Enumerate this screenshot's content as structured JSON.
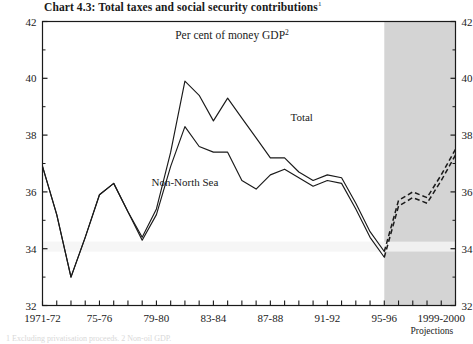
{
  "chart_data": {
    "type": "line",
    "title": "Chart 4.3: Total taxes and social security contributions",
    "title_superscript": "1",
    "subtitle": "Per cent of money GDP",
    "subtitle_superscript": "2",
    "xlabel": "",
    "ylabel": "",
    "ylim": [
      32,
      42
    ],
    "y_ticks": [
      32,
      34,
      36,
      38,
      40,
      42
    ],
    "y_minor_ticks": [
      33,
      35,
      37,
      39,
      41
    ],
    "grid": false,
    "legend_position": "inline-annotations",
    "x_tick_labels": [
      "1971-72",
      "75-76",
      "79-80",
      "83-84",
      "87-88",
      "91-92",
      "95-96",
      "1999-2000"
    ],
    "x_tick_label_indices": [
      0,
      4,
      8,
      12,
      16,
      20,
      24,
      28
    ],
    "x_categories": [
      "1971-72",
      "1972-73",
      "1973-74",
      "1974-75",
      "1975-76",
      "1976-77",
      "1977-78",
      "1978-79",
      "1979-80",
      "1980-81",
      "1981-82",
      "1982-83",
      "1983-84",
      "1984-85",
      "1985-86",
      "1986-87",
      "1987-88",
      "1988-89",
      "1989-90",
      "1990-91",
      "1991-92",
      "1992-93",
      "1993-94",
      "1994-95",
      "1995-96",
      "1996-97",
      "1997-98",
      "1998-99",
      "1999-2000",
      "2000-01"
    ],
    "projection_start_index": 24,
    "projection_band_label": "Projections",
    "projection_band_color": "#d4d4d4",
    "series": [
      {
        "name": "Total",
        "color": "#1a1a1a",
        "annotation": "Total",
        "values": [
          36.9,
          35.2,
          33.0,
          34.4,
          35.9,
          36.3,
          35.3,
          34.4,
          35.4,
          37.4,
          39.9,
          39.4,
          38.5,
          39.3,
          38.6,
          37.9,
          37.2,
          37.2,
          36.7,
          36.4,
          36.6,
          36.5,
          35.6,
          34.6,
          33.9,
          35.7,
          36.0,
          35.8,
          36.6,
          37.5
        ]
      },
      {
        "name": "Non-North Sea",
        "color": "#1a1a1a",
        "annotation": "Non-North Sea",
        "values": [
          36.9,
          35.2,
          33.0,
          34.4,
          35.9,
          36.3,
          35.3,
          34.3,
          35.2,
          36.9,
          38.3,
          37.6,
          37.4,
          37.4,
          36.4,
          36.1,
          36.6,
          36.8,
          36.5,
          36.2,
          36.4,
          36.3,
          35.4,
          34.4,
          33.7,
          35.5,
          35.8,
          35.6,
          36.4,
          37.3
        ]
      }
    ],
    "annotations": [
      {
        "text": "Total",
        "x_index": 18.2,
        "y_value": 38.5
      },
      {
        "text": "Non-North Sea",
        "x_index": 10.0,
        "y_value": 36.2
      }
    ]
  },
  "footnote": "1 Excluding privatisation proceeds.  2 Non-oil GDP."
}
